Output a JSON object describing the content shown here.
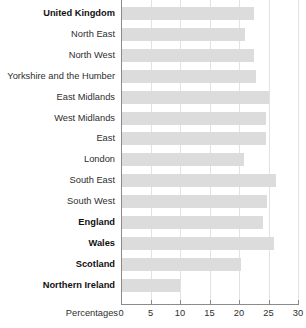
{
  "chart_data": {
    "type": "bar",
    "orientation": "horizontal",
    "title": "",
    "xlabel": "Percentages",
    "ylabel": "",
    "xlim": [
      0,
      30
    ],
    "xticks": [
      0,
      5,
      10,
      15,
      20,
      25,
      30
    ],
    "xtick_labels": [
      "0",
      "5",
      "10",
      "15",
      "20",
      "25",
      "30"
    ],
    "grid": true,
    "grid_axis": "x",
    "legend": false,
    "bar_color": "#dcdcdc",
    "axis_color": "#8b8b8b",
    "gridline_color": "#e2e2e2",
    "categories": [
      "United Kingdom",
      "North East",
      "North West",
      "Yorkshire and the Humber",
      "East Midlands",
      "West Midlands",
      "East",
      "London",
      "South East",
      "South West",
      "England",
      "Wales",
      "Scotland",
      "Northern Ireland"
    ],
    "values": [
      22.6,
      21.1,
      22.6,
      22.8,
      25.0,
      24.5,
      24.5,
      20.8,
      26.2,
      24.7,
      24.0,
      25.9,
      20.4,
      10.0
    ],
    "emphasis": [
      true,
      false,
      false,
      false,
      false,
      false,
      false,
      false,
      false,
      false,
      true,
      true,
      true,
      true
    ]
  }
}
